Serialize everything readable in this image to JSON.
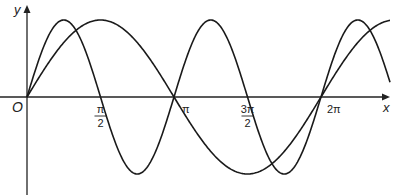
{
  "chart_data": {
    "type": "line",
    "title": "",
    "xlabel": "x",
    "ylabel": "y",
    "origin_label": "O",
    "x_ticks": [
      {
        "value": 1.5708,
        "num": "π",
        "den": "2"
      },
      {
        "value": 3.1416,
        "num": "π",
        "den": ""
      },
      {
        "value": 4.7124,
        "num": "3π",
        "den": "2"
      },
      {
        "value": 6.2832,
        "num": "2π",
        "den": ""
      }
    ],
    "xlim": [
      0,
      7.7
    ],
    "ylim": [
      -1.05,
      1.05
    ],
    "grid": false,
    "legend": false,
    "series": [
      {
        "name": "y = sin x",
        "function": "sin(x)",
        "amplitude": 1,
        "period": 6.2832
      },
      {
        "name": "y = sin 2x",
        "function": "sin(2x)",
        "amplitude": 1,
        "period": 3.1416
      }
    ],
    "colors": {
      "axis": "#222222",
      "curve": "#1a1a1a",
      "background": "#ffffff"
    }
  }
}
